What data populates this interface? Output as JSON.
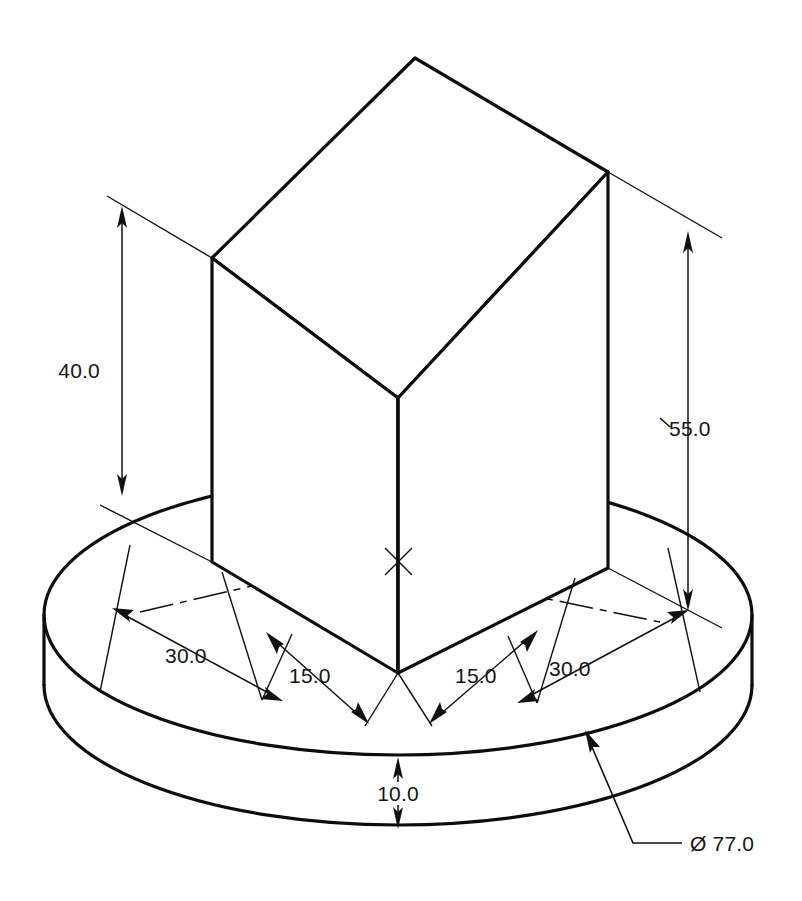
{
  "drawing": {
    "title": "Isometric dimensioned drawing of rectangular block on cylindrical base",
    "units_note": "",
    "background_color": "#ffffff",
    "line_color": "#0d0d0d",
    "dim_color": "#111111"
  },
  "dimensions": [
    {
      "id": "height-block",
      "label": "40.0",
      "value": 40.0,
      "orientation": "vertical",
      "describes": "block-height"
    },
    {
      "id": "height-overall",
      "label": "55.0",
      "value": 55.0,
      "orientation": "vertical",
      "describes": "overall-height"
    },
    {
      "id": "width-left-outer",
      "label": "30.0",
      "value": 30.0,
      "orientation": "isometric-left",
      "describes": "block-half-width-left"
    },
    {
      "id": "width-left-inner",
      "label": "15.0",
      "value": 15.0,
      "orientation": "isometric-right",
      "describes": "block-half-depth-left"
    },
    {
      "id": "width-right-inner",
      "label": "15.0",
      "value": 15.0,
      "orientation": "isometric-left",
      "describes": "block-half-depth-right"
    },
    {
      "id": "width-right-outer",
      "label": "30.0",
      "value": 30.0,
      "orientation": "isometric-right",
      "describes": "block-half-width-right"
    },
    {
      "id": "base-thickness",
      "label": "10.0",
      "value": 10.0,
      "orientation": "vertical",
      "describes": "base-plate-thickness"
    },
    {
      "id": "base-diameter",
      "label": "Ø 77.0",
      "value": 77.0,
      "orientation": "leader",
      "describes": "base-plate-diameter"
    }
  ],
  "labels": {
    "dim_40": "40.0",
    "dim_55": "55.0",
    "dim_30_left": "30.0",
    "dim_15_left": "15.0",
    "dim_15_right": "15.0",
    "dim_30_right": "30.0",
    "dim_10": "10.0",
    "dim_diameter": "Ø 77.0"
  },
  "geometry": {
    "base_ellipse": {
      "cx": 398,
      "cy": 615,
      "rx": 354,
      "ry": 140,
      "thickness_px": 70
    },
    "block": {
      "top_apex": {
        "x": 415,
        "y": 58
      },
      "top_left": {
        "x": 212,
        "y": 258
      },
      "top_right": {
        "x": 608,
        "y": 172
      },
      "top_front": {
        "x": 398,
        "y": 398
      },
      "bottom_left": {
        "x": 212,
        "y": 562
      },
      "bottom_right": {
        "x": 608,
        "y": 568
      },
      "bottom_front": {
        "x": 398,
        "y": 673
      }
    }
  }
}
